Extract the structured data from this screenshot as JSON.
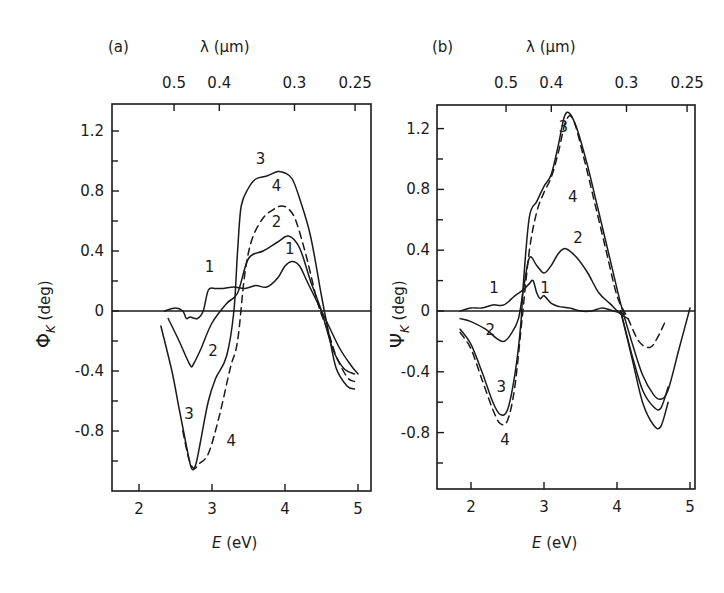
{
  "chart_data": [
    {
      "type": "line",
      "panel_label": "(a)",
      "title": "",
      "xlabel": "E (eV)",
      "ylabel": "Φ_K (deg)",
      "top_axis_label": "λ (μm)",
      "top_tick_labels": [
        "0.5",
        "0.4",
        "0.3",
        "0.25"
      ],
      "top_tick_energies": [
        2.48,
        3.1,
        4.13,
        4.96
      ],
      "x_ticks": [
        2,
        3,
        4,
        5
      ],
      "x_tick_labels": [
        "2",
        "3",
        "4",
        "5"
      ],
      "y_ticks": [
        1.2,
        0.8,
        0.4,
        0,
        -0.4,
        -0.8
      ],
      "y_tick_labels": [
        "1.2",
        "0.8",
        "0.4",
        "0",
        "-0.4",
        "-0.8"
      ],
      "y_minor_ticks": [
        1.0,
        0.6,
        0.2,
        -0.2,
        -0.6,
        -1.0
      ],
      "xlim": [
        1.63,
        5.18
      ],
      "ylim": [
        -1.2,
        1.4
      ],
      "grid": false,
      "zero_line": true,
      "series": [
        {
          "name": "1",
          "style": "solid",
          "x": [
            2.35,
            2.5,
            2.6,
            2.65,
            2.7,
            2.8,
            2.88,
            2.95,
            3.05,
            3.15,
            3.3,
            3.45,
            3.6,
            3.75,
            3.9,
            4.0,
            4.1,
            4.2,
            4.3,
            4.45,
            4.6,
            4.75,
            4.9,
            5.0
          ],
          "y": [
            0.0,
            0.02,
            0.0,
            -0.05,
            -0.04,
            -0.05,
            0.0,
            0.14,
            0.15,
            0.15,
            0.16,
            0.15,
            0.17,
            0.16,
            0.22,
            0.3,
            0.33,
            0.3,
            0.2,
            0.05,
            -0.1,
            -0.25,
            -0.36,
            -0.42
          ],
          "label_pos": {
            "x": 2.9,
            "y": 0.26
          }
        },
        {
          "name": "2",
          "style": "solid",
          "x": [
            2.4,
            2.55,
            2.7,
            2.75,
            2.85,
            3.0,
            3.2,
            3.35,
            3.5,
            3.7,
            3.9,
            4.05,
            4.2,
            4.35,
            4.5,
            4.65,
            4.8,
            4.95
          ],
          "y": [
            -0.05,
            -0.2,
            -0.36,
            -0.35,
            -0.25,
            -0.08,
            0.05,
            0.12,
            0.35,
            0.4,
            0.46,
            0.5,
            0.42,
            0.2,
            0.0,
            -0.25,
            -0.38,
            -0.42
          ],
          "label_pos": {
            "x": 2.95,
            "y": -0.3
          }
        },
        {
          "name": "3",
          "style": "solid",
          "x": [
            2.3,
            2.45,
            2.55,
            2.65,
            2.72,
            2.78,
            2.85,
            2.95,
            3.05,
            3.2,
            3.3,
            3.35,
            3.4,
            3.5,
            3.6,
            3.75,
            3.9,
            4.0,
            4.1,
            4.2,
            4.35,
            4.5,
            4.6,
            4.7,
            4.85,
            4.95
          ],
          "y": [
            -0.1,
            -0.4,
            -0.65,
            -0.9,
            -1.05,
            -1.02,
            -0.85,
            -0.6,
            -0.45,
            -0.3,
            0.0,
            0.4,
            0.7,
            0.82,
            0.88,
            0.9,
            0.93,
            0.92,
            0.88,
            0.75,
            0.5,
            0.1,
            -0.15,
            -0.38,
            -0.5,
            -0.52
          ],
          "label_pos": {
            "x": 2.62,
            "y": -0.72
          }
        },
        {
          "name": "4",
          "style": "dashed",
          "x": [
            2.6,
            2.68,
            2.75,
            2.82,
            2.95,
            3.1,
            3.25,
            3.35,
            3.45,
            3.55,
            3.7,
            3.85,
            3.95,
            4.05,
            4.15,
            4.3,
            4.45,
            4.6,
            4.7,
            4.85,
            4.95
          ],
          "y": [
            -0.8,
            -0.98,
            -1.05,
            -1.02,
            -0.95,
            -0.7,
            -0.38,
            -0.2,
            0.25,
            0.48,
            0.62,
            0.68,
            0.7,
            0.68,
            0.6,
            0.35,
            0.05,
            -0.15,
            -0.3,
            -0.44,
            -0.47
          ],
          "label_pos": {
            "x": 3.2,
            "y": -0.9
          }
        }
      ],
      "curve_labels_top": [
        {
          "name": "3",
          "x": 3.6,
          "y": 0.98
        },
        {
          "name": "4",
          "x": 3.82,
          "y": 0.8
        },
        {
          "name": "2",
          "x": 3.82,
          "y": 0.56
        },
        {
          "name": "1",
          "x": 4.0,
          "y": 0.38
        }
      ]
    },
    {
      "type": "line",
      "panel_label": "(b)",
      "title": "",
      "xlabel": "E (eV)",
      "ylabel": "Ψ_K (deg)",
      "top_axis_label": "λ (μm)",
      "top_tick_labels": [
        "0.5",
        "0.4",
        "0.3",
        "0.25"
      ],
      "top_tick_energies": [
        2.48,
        3.1,
        4.13,
        4.96
      ],
      "x_ticks": [
        2,
        3,
        4,
        5
      ],
      "x_tick_labels": [
        "2",
        "3",
        "4",
        "5"
      ],
      "y_ticks": [
        1.2,
        0.8,
        0.4,
        0,
        -0.4,
        -0.8
      ],
      "y_tick_labels": [
        "1.2",
        "0.8",
        "0.4",
        "0",
        "-0.4",
        "-0.8"
      ],
      "y_minor_ticks": [
        1.0,
        0.6,
        0.2,
        -0.2,
        -0.6,
        -1.0
      ],
      "xlim": [
        1.55,
        5.07
      ],
      "ylim": [
        -1.18,
        1.4
      ],
      "grid": false,
      "zero_line": true,
      "series": [
        {
          "name": "1",
          "style": "solid",
          "x": [
            1.85,
            2.0,
            2.15,
            2.3,
            2.45,
            2.6,
            2.72,
            2.8,
            2.85,
            2.9,
            2.95,
            3.0,
            3.1,
            3.2,
            3.35,
            3.5,
            3.65,
            3.8,
            3.95,
            4.1
          ],
          "y": [
            0.0,
            0.02,
            0.02,
            0.04,
            0.04,
            0.1,
            0.14,
            0.18,
            0.2,
            0.12,
            0.08,
            0.1,
            0.05,
            0.03,
            0.02,
            0.0,
            0.0,
            0.02,
            0.0,
            -0.02
          ],
          "label_pos": {
            "x": 2.25,
            "y": 0.12
          }
        },
        {
          "name": "2",
          "style": "solid",
          "x": [
            1.85,
            2.0,
            2.2,
            2.35,
            2.45,
            2.55,
            2.65,
            2.72,
            2.8,
            2.9,
            3.0,
            3.1,
            3.2,
            3.3,
            3.45,
            3.6,
            3.75,
            3.9,
            4.05,
            4.15
          ],
          "y": [
            -0.05,
            -0.07,
            -0.12,
            -0.18,
            -0.2,
            -0.15,
            -0.05,
            0.15,
            0.35,
            0.3,
            0.25,
            0.3,
            0.38,
            0.41,
            0.35,
            0.25,
            0.12,
            0.05,
            -0.02,
            -0.05
          ],
          "label_pos": {
            "x": 2.2,
            "y": -0.16
          }
        },
        {
          "name": "3",
          "style": "solid",
          "x": [
            1.85,
            2.0,
            2.15,
            2.3,
            2.4,
            2.5,
            2.6,
            2.68,
            2.72,
            2.8,
            2.9,
            3.0,
            3.1,
            3.2,
            3.28,
            3.35,
            3.45,
            3.6,
            3.75,
            3.9,
            4.05,
            4.2,
            4.35,
            4.5,
            4.6,
            4.7,
            4.85,
            5.0
          ],
          "y": [
            -0.12,
            -0.22,
            -0.4,
            -0.6,
            -0.68,
            -0.65,
            -0.42,
            -0.1,
            0.2,
            0.62,
            0.72,
            0.82,
            0.9,
            1.1,
            1.28,
            1.3,
            1.2,
            0.95,
            0.65,
            0.35,
            0.05,
            -0.2,
            -0.42,
            -0.55,
            -0.58,
            -0.52,
            -0.25,
            0.02
          ],
          "label_pos": {
            "x": 2.35,
            "y": -0.53
          }
        },
        {
          "name": "3b",
          "style": "solid",
          "note": "outer trough envelope near 4.5 eV",
          "x": [
            4.05,
            4.2,
            4.35,
            4.5,
            4.6,
            4.7
          ],
          "y": [
            0.0,
            -0.3,
            -0.6,
            -0.75,
            -0.76,
            -0.6
          ]
        },
        {
          "name": "3c",
          "style": "solid",
          "note": "middle trough near 4.5 eV",
          "x": [
            4.05,
            4.2,
            4.35,
            4.5,
            4.6,
            4.7
          ],
          "y": [
            0.0,
            -0.28,
            -0.52,
            -0.63,
            -0.64,
            -0.5
          ]
        },
        {
          "name": "4",
          "style": "dashed",
          "x": [
            1.85,
            2.0,
            2.15,
            2.3,
            2.4,
            2.5,
            2.6,
            2.7,
            2.8,
            2.9,
            3.0,
            3.1,
            3.2,
            3.3,
            3.4,
            3.55,
            3.7,
            3.85,
            4.0,
            4.15,
            4.3,
            4.45,
            4.55,
            4.65
          ],
          "y": [
            -0.14,
            -0.25,
            -0.45,
            -0.65,
            -0.74,
            -0.72,
            -0.5,
            -0.05,
            0.4,
            0.65,
            0.78,
            0.88,
            1.05,
            1.25,
            1.26,
            1.0,
            0.7,
            0.4,
            0.1,
            -0.05,
            -0.2,
            -0.24,
            -0.18,
            -0.08
          ],
          "label_pos": {
            "x": 2.4,
            "y": -0.88
          }
        }
      ],
      "curve_labels_top": [
        {
          "name": "3",
          "x": 3.2,
          "y": 1.18
        },
        {
          "name": "4",
          "x": 3.33,
          "y": 0.72
        },
        {
          "name": "2",
          "x": 3.4,
          "y": 0.45
        },
        {
          "name": "1",
          "x": 2.95,
          "y": 0.12
        }
      ]
    }
  ],
  "panels": {
    "a": {
      "label": "(a)",
      "top_axis": "λ (μm)",
      "xlabel_italic": "E",
      "xlabel_rest": " (eV)",
      "ylabel_symbol": "Φ",
      "ylabel_sub": "K",
      "ylabel_rest": " (deg)"
    },
    "b": {
      "label": "(b)",
      "top_axis": "λ (μm)",
      "xlabel_italic": "E",
      "xlabel_rest": " (eV)",
      "ylabel_symbol": "Ψ",
      "ylabel_sub": "K",
      "ylabel_rest": " (deg)"
    }
  }
}
